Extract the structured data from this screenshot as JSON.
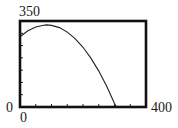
{
  "chart_data": {
    "type": "line",
    "title": "",
    "xlabel": "",
    "ylabel": "",
    "xlim": [
      0,
      400
    ],
    "ylim": [
      0,
      350
    ],
    "x_scale_tick": 50,
    "y_scale_tick": 50,
    "grid": false,
    "window_labels": {
      "xmin": "0",
      "xmax": "400",
      "ymin": "0",
      "ymax": "350"
    },
    "series": [
      {
        "name": "projectile path",
        "x": [
          0,
          25,
          50,
          75,
          84,
          100,
          125,
          150,
          175,
          200,
          225,
          250,
          275,
          300,
          306
        ],
        "y": [
          286,
          310,
          326,
          333,
          334,
          332,
          323,
          305,
          278,
          243,
          199,
          146,
          85,
          14,
          0
        ]
      }
    ]
  },
  "colors": {
    "frame": "#111111",
    "curve": "#222222",
    "background": "#ffffff"
  }
}
